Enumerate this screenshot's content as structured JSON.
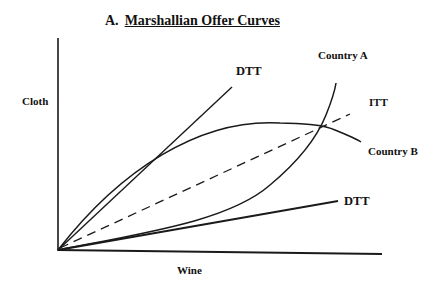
{
  "title": {
    "prefix": "A.",
    "text": "Marshallian Offer Curves"
  },
  "axes": {
    "y_label": "Cloth",
    "x_label": "Wine"
  },
  "labels": {
    "dtt_upper": "DTT",
    "dtt_lower": "DTT",
    "itt": "ITT",
    "country_a": "Country A",
    "country_b": "Country B"
  },
  "colors": {
    "line": "#1a1a1a",
    "background": "#ffffff"
  }
}
